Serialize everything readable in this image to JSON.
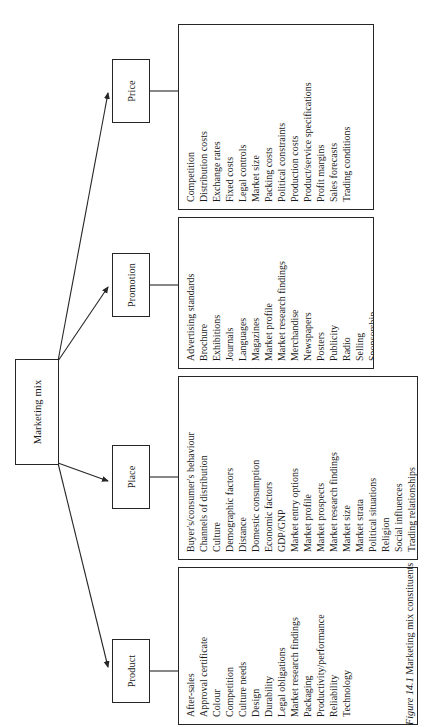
{
  "figure": {
    "caption_label": "Figure 14.1",
    "caption_title": "Marketing mix constituents",
    "root": {
      "label": "Marketing mix"
    },
    "line_color": "#262626",
    "background": "#ffffff"
  },
  "branches": [
    {
      "key": "product",
      "label": "Product",
      "items": [
        "After-sales",
        "Approval certificate",
        "Colour",
        "Competition",
        "Culture needs",
        "Design",
        "Durability",
        "Legal obligations",
        "Market research findings",
        "Packaging",
        "Productivity/performance",
        "Reliability",
        "Technology"
      ]
    },
    {
      "key": "place",
      "label": "Place",
      "items": [
        "Buyer's/consumer's behaviour",
        "Channels of distribution",
        "Culture",
        "Demographic factors",
        "Distance",
        "Domestic consumption",
        "Economic factors",
        "GDP/GNP",
        "Market entry options",
        "Market profile",
        "Market prospects",
        "Market research findings",
        "Market size",
        "Market strata",
        "Political situations",
        "Religion",
        "Social influences",
        "Trading relationships"
      ]
    },
    {
      "key": "promotion",
      "label": "Promotion",
      "items": [
        "Advertising standards",
        "Brochure",
        "Exhibitions",
        "Journals",
        "Languages",
        "Magazines",
        "Market profile",
        "Market research findings",
        "Merchandise",
        "Newspapers",
        "Posters",
        "Publicity",
        "Radio",
        "Selling",
        "Sponsorship",
        "Store promotion",
        "Television"
      ]
    },
    {
      "key": "price",
      "label": "Price",
      "items": [
        "Competition",
        "Distribution costs",
        "Exchange rates",
        "Fixed costs",
        "Legal controls",
        "Market size",
        "Packing costs",
        "Political constraints",
        "Production costs",
        "Product/service specifications",
        "Profit margins",
        "Sales forecasts",
        "Trading conditions"
      ]
    }
  ]
}
